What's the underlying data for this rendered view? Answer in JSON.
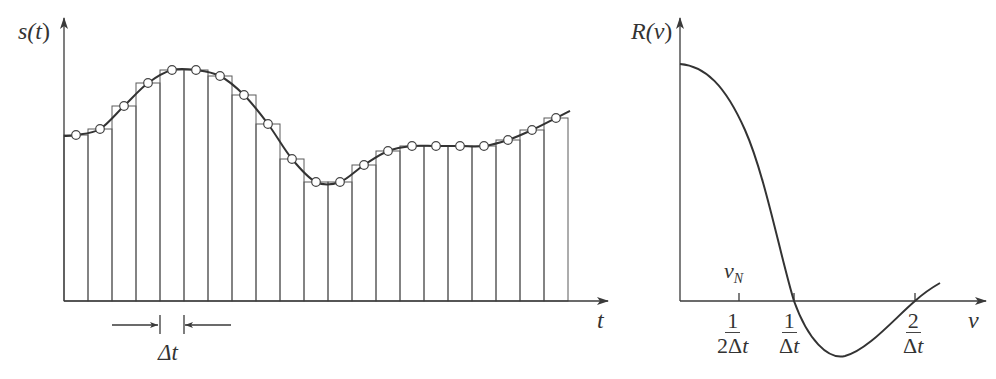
{
  "chart_data": [
    {
      "type": "bar",
      "title": "",
      "description": "Sampled signal s(t) with piecewise-constant (sample-and-hold) bars of width Δt and the continuous signal curve through sample points",
      "ylabel": "s(t)",
      "xlabel": "t",
      "bar_width_label": "Δt",
      "grid": false,
      "n_samples": 21,
      "categories": [
        "1",
        "2",
        "3",
        "4",
        "5",
        "6",
        "7",
        "8",
        "9",
        "10",
        "11",
        "12",
        "13",
        "14",
        "15",
        "16",
        "17",
        "18",
        "19",
        "20",
        "21"
      ],
      "values": [
        166,
        172,
        195,
        218,
        231,
        231,
        225,
        206,
        177,
        142,
        119,
        119,
        136,
        150,
        155,
        155,
        155,
        155,
        161,
        171,
        183
      ],
      "ylim": [
        0,
        240
      ],
      "series": [
        {
          "name": "samples (circles)",
          "values": [
            166,
            172,
            195,
            218,
            231,
            231,
            225,
            206,
            177,
            142,
            119,
            119,
            136,
            150,
            155,
            155,
            155,
            155,
            161,
            171,
            183
          ]
        },
        {
          "name": "s(t) continuous curve",
          "values": [
            166,
            172,
            195,
            218,
            231,
            231,
            225,
            206,
            177,
            142,
            119,
            119,
            136,
            150,
            155,
            155,
            155,
            155,
            161,
            171,
            183
          ]
        }
      ]
    },
    {
      "type": "line",
      "title": "",
      "description": "Response R(ν) versus frequency ν",
      "ylabel": "R(ν)",
      "xlabel": "ν",
      "grid": false,
      "x_ticks": [
        {
          "value": 0.5,
          "label_num": "1",
          "label_den": "2Δt",
          "annotation": "ν_N"
        },
        {
          "value": 1.0,
          "label_num": "1",
          "label_den": "Δt"
        },
        {
          "value": 2.0,
          "label_num": "2",
          "label_den": "Δt"
        }
      ],
      "x": [
        0,
        0.25,
        0.5,
        0.75,
        1.0,
        1.25,
        1.5,
        1.75,
        2.0,
        2.2
      ],
      "series": [
        {
          "name": "R(ν)",
          "values": [
            1.0,
            0.88,
            0.6,
            0.3,
            0.0,
            -0.22,
            -0.2,
            -0.1,
            0.0,
            0.08
          ]
        }
      ],
      "ylim": [
        -0.3,
        1.1
      ]
    }
  ],
  "labels": {
    "left_y": "s(",
    "left_y_var": "t",
    "left_y_close": ")",
    "left_x": "t",
    "delta_t": "Δt",
    "right_y": "R(",
    "right_y_var": "ν",
    "right_y_close": ")",
    "right_x": "ν",
    "nyquist_nu": "ν",
    "nyquist_sub": "N",
    "tick1_num": "1",
    "tick1_den_a": "2Δ",
    "tick1_den_b": "t",
    "tick2_num": "1",
    "tick2_den_a": "Δ",
    "tick2_den_b": "t",
    "tick3_num": "2",
    "tick3_den_a": "Δ",
    "tick3_den_b": "t"
  }
}
